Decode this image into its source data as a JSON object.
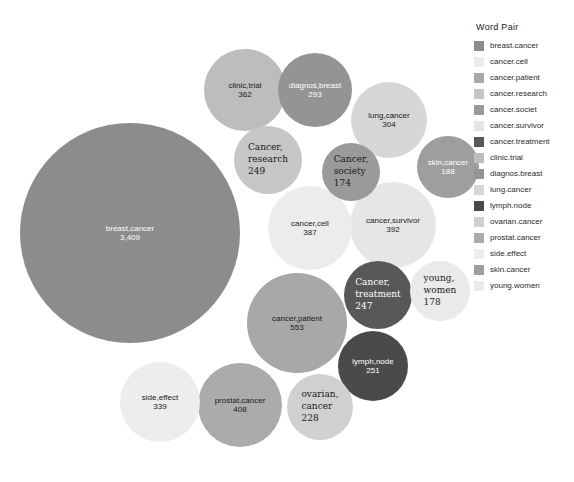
{
  "legend": {
    "title": "Word Pair",
    "items": [
      {
        "label": "breast.cancer",
        "color": "#8c8c8c"
      },
      {
        "label": "cancer.cell",
        "color": "#ececec"
      },
      {
        "label": "cancer.patient",
        "color": "#a8a8a8"
      },
      {
        "label": "cancer.research",
        "color": "#c6c6c6"
      },
      {
        "label": "cancer.societ",
        "color": "#9a9a9a"
      },
      {
        "label": "cancer.survivor",
        "color": "#e6e6e6"
      },
      {
        "label": "cancer.treatment",
        "color": "#585858"
      },
      {
        "label": "clinic.trial",
        "color": "#bdbdbd"
      },
      {
        "label": "diagnos.breast",
        "color": "#949494"
      },
      {
        "label": "lung.cancer",
        "color": "#d6d6d6"
      },
      {
        "label": "lymph.node",
        "color": "#4a4a4a"
      },
      {
        "label": "ovarian.cancer",
        "color": "#d0d0d0"
      },
      {
        "label": "prostat.cancer",
        "color": "#ababab"
      },
      {
        "label": "side.effect",
        "color": "#ededed"
      },
      {
        "label": "skin.cancer",
        "color": "#9e9e9e"
      },
      {
        "label": "young.women",
        "color": "#eaeaea"
      }
    ]
  },
  "chart_data": {
    "type": "bubble",
    "title": "Word Pair",
    "xlabel": "",
    "ylabel": "",
    "legend_position": "right",
    "grid": false,
    "categories": [
      "breast.cancer",
      "cancer.patient",
      "prostat.cancer",
      "cancer.survivor",
      "cancer.cell",
      "clinic.trial",
      "side.effect",
      "lung.cancer",
      "diagnos.breast",
      "lymph.node",
      "cancer.research",
      "cancer.treatment",
      "ovarian.cancer",
      "skin.cancer",
      "young.women",
      "cancer.societ"
    ],
    "values": [
      3409,
      553,
      408,
      392,
      387,
      362,
      339,
      304,
      293,
      251,
      249,
      247,
      228,
      188,
      178,
      174
    ],
    "bubbles": [
      {
        "name": "breast.cancer",
        "pair": "breast,cancer",
        "value": 3409,
        "value_text": "3,409",
        "color": "#8c8c8c",
        "text_color": "#ffffff",
        "cx": 130,
        "cy": 233,
        "r": 110,
        "font": 8,
        "style": "center"
      },
      {
        "name": "cancer.patient",
        "pair": "cancer,patient",
        "value": 553,
        "value_text": "553",
        "color": "#a8a8a8",
        "text_color": "#1a1a1a",
        "cx": 297,
        "cy": 323,
        "r": 50,
        "font": 8,
        "style": "center"
      },
      {
        "name": "prostat.cancer",
        "pair": "prostat,cancer",
        "value": 408,
        "value_text": "408",
        "color": "#ababab",
        "text_color": "#1a1a1a",
        "cx": 240,
        "cy": 405,
        "r": 42,
        "font": 8,
        "style": "center"
      },
      {
        "name": "cancer.survivor",
        "pair": "cancer,survivor",
        "value": 392,
        "value_text": "392",
        "color": "#e6e6e6",
        "text_color": "#1a1a1a",
        "cx": 393,
        "cy": 225,
        "r": 43,
        "font": 8,
        "style": "center"
      },
      {
        "name": "cancer.cell",
        "pair": "cancer,cell",
        "value": 387,
        "value_text": "387",
        "color": "#ececec",
        "text_color": "#1a1a1a",
        "cx": 310,
        "cy": 228,
        "r": 42,
        "font": 8,
        "style": "center"
      },
      {
        "name": "clinic.trial",
        "pair": "clinic,trial",
        "value": 362,
        "value_text": "362",
        "color": "#bdbdbd",
        "text_color": "#1a1a1a",
        "cx": 245,
        "cy": 90,
        "r": 41,
        "font": 8,
        "style": "center"
      },
      {
        "name": "side.effect",
        "pair": "side,effect",
        "value": 339,
        "value_text": "339",
        "color": "#ededed",
        "text_color": "#1a1a1a",
        "cx": 160,
        "cy": 402,
        "r": 40,
        "font": 8,
        "style": "center"
      },
      {
        "name": "lung.cancer",
        "pair": "lung,cancer",
        "value": 304,
        "value_text": "304",
        "color": "#d6d6d6",
        "text_color": "#1a1a1a",
        "cx": 389,
        "cy": 120,
        "r": 38,
        "font": 8,
        "style": "center"
      },
      {
        "name": "diagnos.breast",
        "pair": "diagnos,breast",
        "value": 293,
        "value_text": "293",
        "color": "#949494",
        "text_color": "#ffffff",
        "cx": 315,
        "cy": 90,
        "r": 37,
        "font": 8,
        "style": "center"
      },
      {
        "name": "lymph.node",
        "pair": "lymph,node",
        "value": 251,
        "value_text": "251",
        "color": "#4a4a4a",
        "text_color": "#ffffff",
        "cx": 373,
        "cy": 366,
        "r": 35,
        "font": 8,
        "style": "center"
      },
      {
        "name": "cancer.research",
        "pair": "Cancer,",
        "line2": "research",
        "value": 249,
        "value_text": "249",
        "color": "#c6c6c6",
        "text_color": "#1a1a1a",
        "cx": 268,
        "cy": 160,
        "r": 34,
        "font": 9,
        "style": "alt"
      },
      {
        "name": "cancer.treatment",
        "pair": "Cancer,",
        "line2": "treatment",
        "value": 247,
        "value_text": "247",
        "color": "#585858",
        "text_color": "#ffffff",
        "cx": 378,
        "cy": 295,
        "r": 34,
        "font": 9,
        "style": "alt"
      },
      {
        "name": "ovarian.cancer",
        "pair": "ovarian,",
        "line2": "cancer",
        "value": 228,
        "value_text": "228",
        "color": "#d0d0d0",
        "text_color": "#1a1a1a",
        "cx": 320,
        "cy": 407,
        "r": 33,
        "font": 9,
        "style": "alt"
      },
      {
        "name": "skin.cancer",
        "pair": "skin,cancer",
        "value": 188,
        "value_text": "188",
        "color": "#9e9e9e",
        "text_color": "#ffffff",
        "cx": 448,
        "cy": 167,
        "r": 31,
        "font": 8,
        "style": "center"
      },
      {
        "name": "young.women",
        "pair": "young,",
        "line2": "women",
        "value": 178,
        "value_text": "178",
        "color": "#eaeaea",
        "text_color": "#1a1a1a",
        "cx": 440,
        "cy": 291,
        "r": 30,
        "font": 9,
        "style": "alt"
      },
      {
        "name": "cancer.societ",
        "pair": "Cancer,",
        "line2": "society",
        "value": 174,
        "value_text": "174",
        "color": "#9a9a9a",
        "text_color": "#1a1a1a",
        "cx": 351,
        "cy": 172,
        "r": 29,
        "font": 9,
        "style": "alt"
      }
    ]
  }
}
